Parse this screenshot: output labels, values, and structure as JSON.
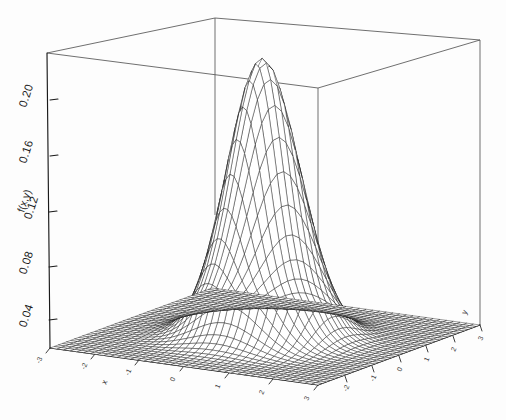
{
  "figure": {
    "background": "#fdfdfd",
    "line_color": "#111111",
    "box_color": "#555555"
  },
  "chart_data": {
    "type": "surface",
    "title": "",
    "subtitle": "",
    "xlabel": "x",
    "ylabel": "y",
    "zlabel": "f(x,y)",
    "grid": false,
    "legend": "none",
    "z_ticks": [
      0.04,
      0.08,
      0.12,
      0.16,
      0.2
    ],
    "z_tick_labels": [
      "0.04",
      "0.08",
      "0.12",
      "0.16",
      "0.20"
    ],
    "zlim": [
      0.0,
      0.225
    ],
    "x_ticks": [
      -3,
      -2,
      -1,
      0,
      1,
      2,
      3
    ],
    "x_tick_labels": [
      "-3",
      "-2",
      "-1",
      "0",
      "1",
      "2",
      "3"
    ],
    "xlim": [
      -3.2,
      3.2
    ],
    "y_ticks": [
      -3,
      -2,
      -1,
      0,
      1,
      2,
      3
    ],
    "y_tick_labels": [
      "-3",
      "-2",
      "-1",
      "0",
      "1",
      "2",
      "3"
    ],
    "ylim": [
      -3.2,
      3.2
    ],
    "peak_value": 0.2122,
    "peak_x": 0,
    "peak_y": 0,
    "mesh_rows": 41,
    "mesh_cols": 41,
    "surface_params": {
      "function": "bivariate_normal",
      "sigma_x": 0.75,
      "sigma_y": 0.75,
      "amplitude": 0.2122
    },
    "view": {
      "azimuth": -45,
      "elevation": 22
    }
  },
  "axes": {
    "z_title": "f(x,y)",
    "x_title": "x",
    "y_title": "y"
  }
}
